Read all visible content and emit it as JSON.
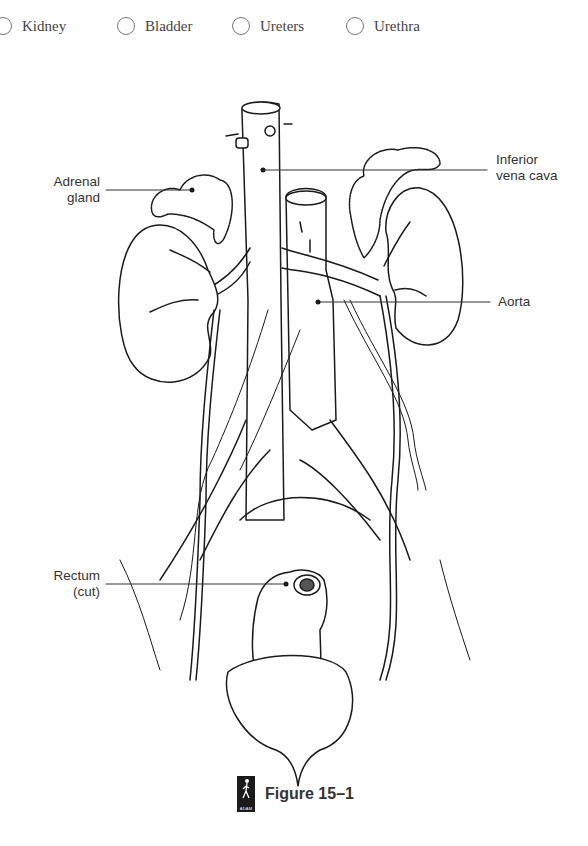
{
  "options": [
    {
      "label": "Kidney",
      "selected": false
    },
    {
      "label": "Bladder",
      "selected": false
    },
    {
      "label": "Ureters",
      "selected": false
    },
    {
      "label": "Urethra",
      "selected": false
    }
  ],
  "figure": {
    "labels": {
      "adrenal_gland": [
        "Adrenal",
        "gland"
      ],
      "inferior_vena_cava": [
        "Inferior",
        "vena cava"
      ],
      "aorta": "Aorta",
      "rectum": [
        "Rectum",
        "(cut)"
      ]
    },
    "caption": "Figure 15–1",
    "logo_text": "ADAM"
  }
}
